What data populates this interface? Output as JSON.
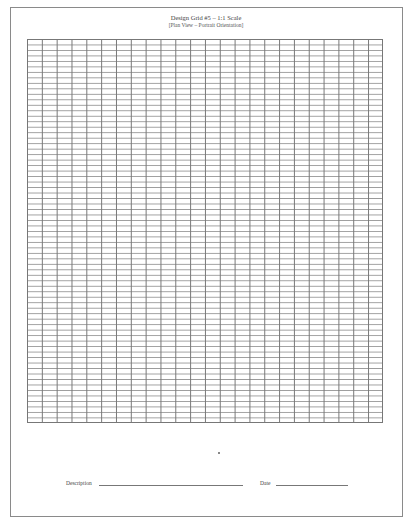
{
  "document": {
    "title": "Design Grid #5 – 1:1 Scale",
    "subtitle": "[Plan View – Portrait Orientation]"
  },
  "grid": {
    "columns": 24,
    "rows": 70,
    "line_color": "#777777"
  },
  "footer": {
    "description_label": "Description",
    "description_value": "",
    "date_label": "Date",
    "date_value": ""
  }
}
